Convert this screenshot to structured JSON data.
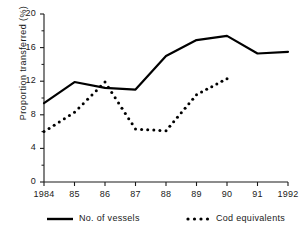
{
  "chart_data": {
    "type": "line",
    "title": "",
    "xlabel": "",
    "ylabel": "Proportion transferred (%)",
    "x": [
      1984,
      1985,
      1986,
      1987,
      1988,
      1989,
      1990,
      1991,
      1992
    ],
    "xtick_labels": [
      "1984",
      "85",
      "86",
      "87",
      "88",
      "89",
      "90",
      "91",
      "1992"
    ],
    "ytick_labels": [
      "0",
      "4",
      "8",
      "12",
      "16",
      "20"
    ],
    "yticks": [
      0,
      4,
      8,
      12,
      16,
      20
    ],
    "ylim": [
      0,
      20
    ],
    "xlim": [
      1984,
      1992
    ],
    "grid": false,
    "legend_position": "below",
    "series": [
      {
        "name": "No. of vessels",
        "style": "solid",
        "color": "#000000",
        "x": [
          1984,
          1985,
          1986,
          1987,
          1988,
          1989,
          1990,
          1991,
          1992
        ],
        "values": [
          9.4,
          11.9,
          11.2,
          11.0,
          15.0,
          16.9,
          17.4,
          15.3,
          15.5
        ]
      },
      {
        "name": "Cod equivalents",
        "style": "dotted",
        "color": "#000000",
        "x": [
          1984,
          1985,
          1986,
          1987,
          1988,
          1989,
          1990
        ],
        "values": [
          6.0,
          8.3,
          11.9,
          6.3,
          6.1,
          10.4,
          12.3
        ]
      }
    ]
  },
  "legend": {
    "items": [
      {
        "label": "No. of vessels",
        "style": "solid"
      },
      {
        "label": "Cod equivalents",
        "style": "dotted"
      }
    ]
  }
}
